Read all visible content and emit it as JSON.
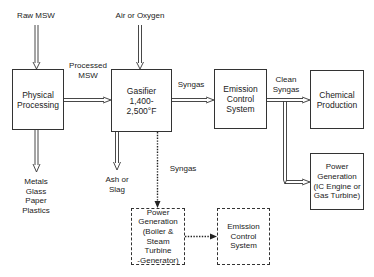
{
  "diagram": {
    "type": "process-flow",
    "nodes": {
      "physical_processing": {
        "label": "Physical\nProcessing",
        "style": "solid"
      },
      "gasifier": {
        "label": "Gasifier\n1,400-\n2,500°F",
        "style": "solid"
      },
      "emission_control_1": {
        "label": "Emission\nControl\nSystem",
        "style": "solid"
      },
      "chemical_production": {
        "label": "Chemical\nProduction",
        "style": "solid"
      },
      "power_generation_ic": {
        "label": "Power\nGeneration\n(IC Engine or\nGas Turbine)",
        "style": "solid"
      },
      "power_generation_steam": {
        "label": "Power\nGeneration\n(Boiler &\nSteam Turbine\n-Generator)",
        "style": "dashed"
      },
      "emission_control_2": {
        "label": "Emission\nControl\nSystem",
        "style": "dashed"
      }
    },
    "labels": {
      "raw_msw": "Raw MSW",
      "air_or_oxygen": "Air or Oxygen",
      "processed_msw": "Processed\nMSW",
      "syngas_top": "Syngas",
      "clean_syngas": "Clean\nSyngas",
      "recovered_materials": "Metals\nGlass\nPaper\nPlastics",
      "ash_or_slag": "Ash or\nSlag",
      "syngas_dotted": "Syngas"
    },
    "edges": [
      {
        "from": "Raw MSW",
        "to": "physical_processing",
        "style": "double"
      },
      {
        "from": "Air or Oxygen",
        "to": "gasifier",
        "style": "double"
      },
      {
        "from": "physical_processing",
        "to": "gasifier",
        "label": "Processed MSW",
        "style": "double"
      },
      {
        "from": "physical_processing",
        "to": "Metals Glass Paper Plastics",
        "style": "double"
      },
      {
        "from": "gasifier",
        "to": "emission_control_1",
        "label": "Syngas",
        "style": "double"
      },
      {
        "from": "gasifier",
        "to": "Ash or Slag",
        "style": "double"
      },
      {
        "from": "gasifier",
        "to": "power_generation_steam",
        "label": "Syngas",
        "style": "dotted"
      },
      {
        "from": "emission_control_1",
        "to": "chemical_production",
        "label": "Clean Syngas",
        "style": "double"
      },
      {
        "from": "emission_control_1",
        "to": "power_generation_ic",
        "style": "double"
      },
      {
        "from": "power_generation_steam",
        "to": "emission_control_2",
        "style": "dotted"
      }
    ],
    "colors": {
      "line": "#333333",
      "background": "#ffffff",
      "text": "#222222"
    }
  }
}
